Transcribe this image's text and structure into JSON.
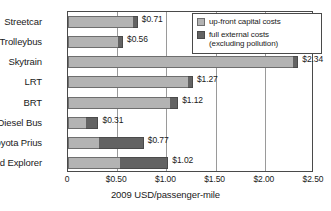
{
  "chart_data": {
    "type": "bar",
    "orientation": "horizontal",
    "stacked": true,
    "title": "",
    "xlabel": "2009 USD/passenger-mile",
    "ylabel": "",
    "xlim": [
      0,
      2.5
    ],
    "xticks": [
      0,
      0.5,
      1.0,
      1.5,
      2.0,
      2.5
    ],
    "xticklabels": [
      "0",
      "$0.50",
      "$1.00",
      "$1.50",
      "$2.00",
      "$2.50"
    ],
    "grid": "vertical",
    "legend_position": "top-right",
    "categories": [
      "Streetcar",
      "Trolleybus",
      "Skytrain",
      "LRT",
      "BRT",
      "Diesel Bus",
      "Toyota Prius",
      "Ford Explorer"
    ],
    "series": [
      {
        "name": "up-front capital costs",
        "color": "#b3b3b3",
        "values": [
          0.66,
          0.51,
          2.29,
          1.22,
          1.04,
          0.18,
          0.32,
          0.53
        ]
      },
      {
        "name": "full external costs (excluding pollution)",
        "color": "#636363",
        "values": [
          0.05,
          0.05,
          0.05,
          0.05,
          0.08,
          0.13,
          0.45,
          0.49
        ]
      }
    ],
    "totals": [
      0.71,
      0.56,
      2.34,
      1.27,
      1.12,
      0.31,
      0.77,
      1.02
    ],
    "total_labels": [
      "$0.71",
      "$0.56",
      "$2.34",
      "$1.27",
      "$1.12",
      "$0.31",
      "$0.77",
      "$1.02"
    ]
  },
  "legend": {
    "items": [
      {
        "label_line1": "up-front capital costs",
        "label_line2": ""
      },
      {
        "label_line1": "full external costs",
        "label_line2": "(excluding pollution)"
      }
    ]
  },
  "colors": {
    "capital": "#b3b3b3",
    "external": "#636363",
    "axis": "#4a4a4a",
    "grid": "#9a9a9a",
    "text": "#1a1a1a",
    "background": "#ffffff"
  }
}
